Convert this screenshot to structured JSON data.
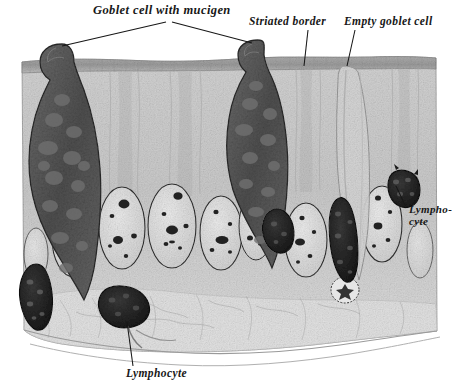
{
  "figure": {
    "title": "Goblet cell with mucigen",
    "background_color": "#ffffff",
    "ink_color": "#171717",
    "tissue_fill": "#c9c9c9",
    "goblet_fill": "#5a5a5a",
    "lymphocyte_fill": "#242424",
    "nucleus_fill": "#dedede"
  },
  "labels": {
    "goblet_cell": "Goblet cell with mucigen",
    "striated_border": "Striated border",
    "empty_goblet_cell": "Empty goblet cell",
    "lymphocyte_right_line1": "Lympho-",
    "lymphocyte_right_line2": "cyte",
    "lymphocyte_bottom": "Lymphocyte"
  },
  "structures": {
    "goblet_cells": [
      {
        "name": "left-goblet-cell",
        "cx": 70,
        "cy": 135,
        "state": "with-mucigen"
      },
      {
        "name": "center-goblet-cell",
        "cx": 258,
        "cy": 125,
        "state": "with-mucigen"
      },
      {
        "name": "right-goblet-cell",
        "cx": 352,
        "cy": 130,
        "state": "empty"
      }
    ],
    "lymphocytes": [
      {
        "name": "lymphocyte-left-margin",
        "cx": 40,
        "cy": 295
      },
      {
        "name": "lymphocyte-basal-center",
        "cx": 124,
        "cy": 310
      },
      {
        "name": "lymphocyte-mid-right",
        "cx": 280,
        "cy": 228
      },
      {
        "name": "lymphocyte-columnar",
        "cx": 343,
        "cy": 240
      },
      {
        "name": "lymphocyte-upper-right",
        "cx": 404,
        "cy": 186
      }
    ],
    "nuclei_count": 9,
    "striated_border_band": {
      "y_top": 56,
      "thickness": 10
    }
  }
}
